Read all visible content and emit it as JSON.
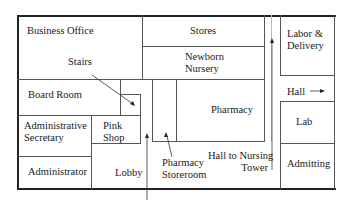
{
  "diagram": {
    "type": "floor-plan",
    "rooms": [
      {
        "id": "business-office",
        "label": "Business Office"
      },
      {
        "id": "stores",
        "label": "Stores"
      },
      {
        "id": "newborn-nursery",
        "label_line1": "Newborn",
        "label_line2": "Nursery"
      },
      {
        "id": "labor-delivery",
        "label_line1": "Labor &",
        "label_line2": "Delivery"
      },
      {
        "id": "board-room",
        "label": "Board Room"
      },
      {
        "id": "pharmacy",
        "label": "Pharmacy"
      },
      {
        "id": "admin-secretary",
        "label_line1": "Administrative",
        "label_line2": "Secretary"
      },
      {
        "id": "pink-shop",
        "label_line1": "Pink",
        "label_line2": "Shop"
      },
      {
        "id": "lab",
        "label": "Lab"
      },
      {
        "id": "administrator",
        "label": "Administrator"
      },
      {
        "id": "lobby",
        "label": "Lobby"
      },
      {
        "id": "pharmacy-storeroom",
        "label_line1": "Pharmacy",
        "label_line2": "Storeroom"
      },
      {
        "id": "admitting",
        "label": "Admitting"
      }
    ],
    "annotations": {
      "stairs": "Stairs",
      "hall": "Hall",
      "hall_to_tower_line1": "Hall to Nursing",
      "hall_to_tower_line2": "Tower"
    },
    "colors": {
      "wall": "#555555",
      "outer_wall": "#222222",
      "background": "#ffffff"
    }
  }
}
